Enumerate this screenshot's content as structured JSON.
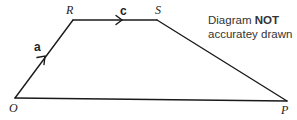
{
  "diagram": {
    "points": {
      "O": {
        "label": "O",
        "x": 15,
        "y": 98
      },
      "R": {
        "label": "R",
        "x": 73,
        "y": 20
      },
      "S": {
        "label": "S",
        "x": 157,
        "y": 20
      },
      "P": {
        "label": "P",
        "x": 287,
        "y": 101
      }
    },
    "vectors": {
      "a": {
        "label": "a",
        "from": "O",
        "to": "R"
      },
      "c": {
        "label": "c",
        "from": "R",
        "to": "S"
      }
    },
    "note": {
      "prefix": "Diagram ",
      "emphasis": "NOT",
      "line2": "accuratey drawn"
    },
    "line_color": "#1a1a1a"
  }
}
